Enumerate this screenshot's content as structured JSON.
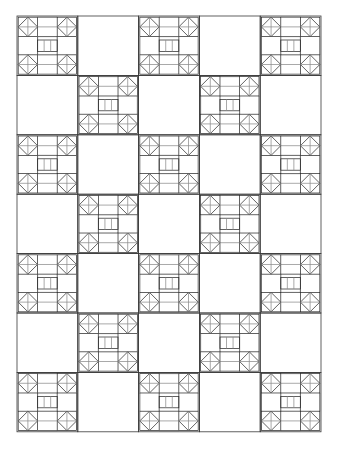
{
  "document": {
    "title": "Quilt Block Layout",
    "canvas": {
      "width": 338,
      "height": 452,
      "background": "#ffffff"
    }
  },
  "grid": {
    "origin_x": 17,
    "origin_y": 16,
    "columns": 5,
    "rows": 7,
    "cell_width": 60.8,
    "cell_height": 59.4,
    "outline_color": "#3a3a3a",
    "outline_width": 0.8,
    "pattern": "checkerboard",
    "filled_parity": "even",
    "filled_cells": [
      [
        0,
        0
      ],
      [
        2,
        0
      ],
      [
        4,
        0
      ],
      [
        1,
        1
      ],
      [
        3,
        1
      ],
      [
        0,
        2
      ],
      [
        2,
        2
      ],
      [
        4,
        2
      ],
      [
        1,
        3
      ],
      [
        3,
        3
      ],
      [
        0,
        4
      ],
      [
        2,
        4
      ],
      [
        4,
        4
      ],
      [
        1,
        5
      ],
      [
        3,
        5
      ],
      [
        0,
        6
      ],
      [
        2,
        6
      ],
      [
        4,
        6
      ]
    ],
    "empty_cells": [
      [
        1,
        0
      ],
      [
        3,
        0
      ],
      [
        0,
        1
      ],
      [
        2,
        1
      ],
      [
        4,
        1
      ],
      [
        1,
        2
      ],
      [
        3,
        2
      ],
      [
        0,
        3
      ],
      [
        2,
        3
      ],
      [
        4,
        3
      ],
      [
        1,
        4
      ],
      [
        3,
        4
      ],
      [
        0,
        5
      ],
      [
        2,
        5
      ],
      [
        4,
        5
      ],
      [
        1,
        6
      ],
      [
        3,
        6
      ]
    ]
  },
  "block": {
    "name": "square-in-square-corner-block",
    "corner_unit_fraction": 0.34,
    "center_strip_count": 3,
    "center_strip_height_fraction": 0.2,
    "line_color": "#2e2e2e",
    "light_line_color": "#8c8c8c",
    "line_width": 0.75,
    "fill": "none",
    "description": "Four corner square-in-square units with inscribed diamonds and full diagonals, joined by horizontal rails and a central band of three rectangles."
  },
  "legend": {
    "block_label": "Block",
    "empty_label": "Plain",
    "corner_unit_label": "Square-in-square",
    "center_strip_label": "Three-patch bar"
  }
}
